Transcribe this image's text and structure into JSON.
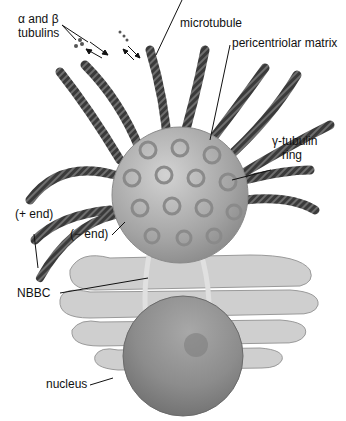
{
  "figure": {
    "type": "biological-diagram"
  },
  "labels": {
    "tubulins_line1": "α and β",
    "tubulins_line2": "tubulins",
    "microtubule": "microtubule",
    "pericentriolar_matrix": "pericentriolar matrix",
    "gamma_ring_line1": "γ-tubulin",
    "gamma_ring_line2": "ring",
    "plus_end": "(+ end)",
    "minus_end": "(− end)",
    "nbbc": "NBBC",
    "nucleus": "nucleus"
  },
  "colors": {
    "microtubule": "#3a3a3a",
    "microtubule_stripe": "#777777",
    "centrosome": "#a9a9a9",
    "ring": "#8a8a8a",
    "golgi": "#c8c8c8",
    "nucleus": "#8f8f8f",
    "leader_line": "#111111"
  }
}
